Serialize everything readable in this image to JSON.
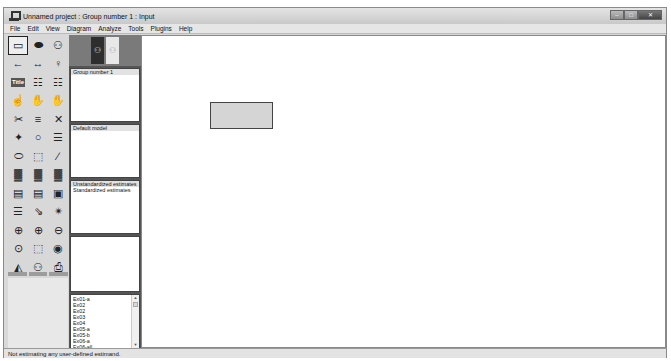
{
  "window": {
    "title": "Unnamed project : Group number 1 : Input",
    "controls": {
      "minimize": "–",
      "maximize": "□",
      "close": "✕"
    }
  },
  "menubar": {
    "items": [
      "File",
      "Edit",
      "View",
      "Diagram",
      "Analyze",
      "Tools",
      "Plugins",
      "Help"
    ]
  },
  "toolbox": {
    "tools": [
      {
        "name": "draw-observed-variable",
        "glyph": "▭"
      },
      {
        "name": "draw-unobserved-variable",
        "glyph": "⬬"
      },
      {
        "name": "draw-latent-indicator",
        "glyph": "⚇"
      },
      {
        "name": "draw-path",
        "glyph": "←"
      },
      {
        "name": "draw-covariance",
        "glyph": "↔"
      },
      {
        "name": "add-unique-variable",
        "glyph": "♀"
      },
      {
        "name": "figure-caption",
        "glyph": "Title"
      },
      {
        "name": "list-variables-in-model",
        "glyph": "☷"
      },
      {
        "name": "list-variables-in-dataset",
        "glyph": "☷"
      },
      {
        "name": "select-one-object",
        "glyph": "☝"
      },
      {
        "name": "select-all-objects",
        "glyph": "✋"
      },
      {
        "name": "deselect-all",
        "glyph": "✋"
      },
      {
        "name": "duplicate-objects",
        "glyph": "✂"
      },
      {
        "name": "move-objects",
        "glyph": "≡"
      },
      {
        "name": "erase-objects",
        "glyph": "✕"
      },
      {
        "name": "change-shape",
        "glyph": "✦"
      },
      {
        "name": "rotate-indicators",
        "glyph": "○"
      },
      {
        "name": "reflect-indicators",
        "glyph": "☰"
      },
      {
        "name": "move-parameters",
        "glyph": "⬭"
      },
      {
        "name": "scroll-diagram",
        "glyph": "⬚"
      },
      {
        "name": "touch-up",
        "glyph": "∕"
      },
      {
        "name": "select-data-files",
        "glyph": "▓"
      },
      {
        "name": "analysis-properties",
        "glyph": "▓"
      },
      {
        "name": "calculate-estimates",
        "glyph": "▓"
      },
      {
        "name": "copy-to-clipboard",
        "glyph": "▤"
      },
      {
        "name": "view-text-output",
        "glyph": "▤"
      },
      {
        "name": "save-diagram",
        "glyph": "▣"
      },
      {
        "name": "object-properties",
        "glyph": "☰"
      },
      {
        "name": "drag-properties",
        "glyph": "⇘"
      },
      {
        "name": "preserve-symmetries",
        "glyph": "✴"
      },
      {
        "name": "zoom-in-area",
        "glyph": "⊕"
      },
      {
        "name": "zoom-in",
        "glyph": "⊕"
      },
      {
        "name": "zoom-out",
        "glyph": "⊖"
      },
      {
        "name": "zoom-page",
        "glyph": "⊙"
      },
      {
        "name": "fit-to-page",
        "glyph": "⬚"
      },
      {
        "name": "loupe",
        "glyph": "◉"
      },
      {
        "name": "bayesian-estimation",
        "glyph": "◭"
      },
      {
        "name": "multiple-group-analysis",
        "glyph": "⚇"
      },
      {
        "name": "print",
        "glyph": "⎙"
      },
      {
        "name": "undo",
        "glyph": "↶"
      },
      {
        "name": "redo",
        "glyph": "↷"
      },
      {
        "name": "specification-search",
        "glyph": "⚉"
      }
    ]
  },
  "view_switch": {
    "input_label": "⚇",
    "output_label": "⚇"
  },
  "panels": {
    "groups": {
      "items": [
        "Group number 1"
      ]
    },
    "models": {
      "items": [
        "Default model"
      ]
    },
    "estimates": {
      "items": [
        "Unstandardized estimates",
        "Standardized estimates"
      ]
    },
    "files": {
      "items": [
        "Ex01-a",
        "Ex02",
        "Ex02",
        "Ex03",
        "Ex04",
        "Ex05-a",
        "Ex05-b",
        "Ex06-a",
        "Ex06-all"
      ]
    }
  },
  "canvas": {
    "objects": [
      {
        "type": "observed-variable",
        "label": ""
      }
    ]
  },
  "statusbar": {
    "text": "Not estimating any user-defined estimand."
  }
}
